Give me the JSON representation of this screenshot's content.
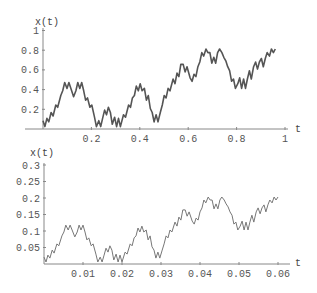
{
  "chart_data": [
    {
      "type": "line",
      "title": "",
      "xlabel": "t",
      "ylabel": "x(t)",
      "xlim": [
        0,
        1
      ],
      "ylim": [
        0,
        1
      ],
      "xticks": [
        0.2,
        0.4,
        0.6,
        0.8,
        1
      ],
      "xtick_labels": [
        "0.2",
        "0.4",
        "0.6",
        "0.8",
        "1"
      ],
      "yticks": [
        0.2,
        0.4,
        0.6,
        0.8,
        1
      ],
      "ytick_labels": [
        "0.2",
        "0.4",
        "0.6",
        "0.8",
        "1"
      ],
      "grid": false,
      "line_color": "#555555",
      "line_width": 1.6,
      "scale_from_series": {
        "t_factor": 16,
        "x_factor": 4
      }
    },
    {
      "type": "line",
      "title": "",
      "xlabel": "t",
      "ylabel": "x(t)",
      "xlim": [
        0,
        0.0625
      ],
      "ylim": [
        0,
        0.3
      ],
      "xticks": [
        0.01,
        0.02,
        0.03,
        0.04,
        0.05,
        0.06
      ],
      "xtick_labels": [
        "0.01",
        "0.02",
        "0.03",
        "0.04",
        "0.05",
        "0.06"
      ],
      "yticks": [
        0.05,
        0.1,
        0.15,
        0.2,
        0.25,
        0.3
      ],
      "ytick_labels": [
        "0.05",
        "0.1",
        "0.15",
        "0.2",
        "0.25",
        "0.3"
      ],
      "grid": false,
      "line_color": "#777777",
      "line_width": 1,
      "series": [
        {
          "name": "x(t)",
          "t": [
            0,
            0.0005,
            0.001,
            0.0015,
            0.0021,
            0.0026,
            0.0033,
            0.0038,
            0.0046,
            0.0051,
            0.0056,
            0.0062,
            0.0067,
            0.0072,
            0.0079,
            0.0085,
            0.009,
            0.0095,
            0.01,
            0.0105,
            0.011,
            0.0115,
            0.0121,
            0.0126,
            0.0133,
            0.0138,
            0.0144,
            0.0149,
            0.0154,
            0.0159,
            0.0164,
            0.0169,
            0.0174,
            0.0179,
            0.0185,
            0.019,
            0.0195,
            0.02,
            0.0208,
            0.0213,
            0.0221,
            0.0226,
            0.0231,
            0.0236,
            0.0241,
            0.0246,
            0.0251,
            0.0256,
            0.0262,
            0.0267,
            0.0272,
            0.0277,
            0.0282,
            0.0287,
            0.0292,
            0.0297,
            0.0303,
            0.0308,
            0.0313,
            0.0318,
            0.0323,
            0.0328,
            0.0336,
            0.0341,
            0.0346,
            0.0351,
            0.0356,
            0.0362,
            0.0367,
            0.0372,
            0.038,
            0.0385,
            0.039,
            0.0395,
            0.04,
            0.0405,
            0.041,
            0.0415,
            0.0421,
            0.0426,
            0.0431,
            0.0436,
            0.0441,
            0.0446,
            0.0451,
            0.0456,
            0.0462,
            0.0467,
            0.0472,
            0.0477,
            0.0482,
            0.0487,
            0.0492,
            0.0497,
            0.0503,
            0.0508,
            0.0513,
            0.0518,
            0.0523,
            0.0528,
            0.0533,
            0.0538,
            0.0544,
            0.0549,
            0.0554,
            0.0559,
            0.0564,
            0.0569,
            0.0574,
            0.0579,
            0.0585,
            0.059,
            0.0595,
            0.06
          ],
          "x": [
            0.021,
            0.006,
            0.027,
            0.018,
            0.042,
            0.033,
            0.061,
            0.055,
            0.085,
            0.097,
            0.118,
            0.103,
            0.118,
            0.103,
            0.082,
            0.097,
            0.118,
            0.103,
            0.118,
            0.097,
            0.073,
            0.079,
            0.055,
            0.061,
            0.03,
            0.006,
            0.021,
            0.006,
            0.027,
            0.048,
            0.036,
            0.055,
            0.042,
            0.012,
            0.03,
            0.006,
            0.027,
            0.006,
            0.036,
            0.03,
            0.061,
            0.055,
            0.079,
            0.085,
            0.109,
            0.097,
            0.115,
            0.097,
            0.103,
            0.073,
            0.085,
            0.052,
            0.042,
            0.018,
            0.036,
            0.018,
            0.042,
            0.061,
            0.085,
            0.079,
            0.103,
            0.097,
            0.127,
            0.115,
            0.142,
            0.133,
            0.164,
            0.164,
            0.145,
            0.158,
            0.13,
            0.121,
            0.139,
            0.133,
            0.158,
            0.17,
            0.194,
            0.185,
            0.203,
            0.194,
            0.194,
            0.167,
            0.182,
            0.167,
            0.194,
            0.203,
            0.194,
            0.182,
            0.173,
            0.158,
            0.148,
            0.121,
            0.127,
            0.103,
            0.115,
            0.13,
            0.103,
            0.127,
            0.103,
            0.127,
            0.148,
            0.127,
            0.158,
            0.17,
            0.152,
            0.17,
            0.179,
            0.158,
            0.179,
            0.194,
            0.185,
            0.203,
            0.194,
            0.203
          ]
        }
      ]
    }
  ],
  "plots": {
    "top": {
      "ylabel": "x(t)",
      "xlabel": "t"
    },
    "bottom": {
      "ylabel": "x(t)",
      "xlabel": "t"
    }
  }
}
